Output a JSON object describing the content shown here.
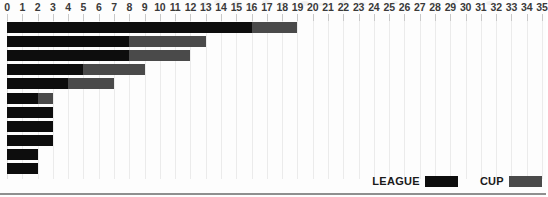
{
  "chart_data": {
    "type": "bar",
    "orientation": "horizontal",
    "stacked": true,
    "title": "",
    "xlabel": "",
    "ylabel": "",
    "xlim": [
      0,
      35
    ],
    "grid": true,
    "legend_position": "bottom-right",
    "x_ticks": [
      0,
      1,
      2,
      3,
      4,
      5,
      6,
      7,
      8,
      9,
      10,
      11,
      12,
      13,
      14,
      15,
      16,
      17,
      18,
      19,
      20,
      21,
      22,
      23,
      24,
      25,
      26,
      27,
      28,
      29,
      30,
      31,
      32,
      33,
      34,
      35
    ],
    "x_tick_labels": [
      "0",
      "1",
      "2",
      "3",
      "4",
      "5",
      "6",
      "7",
      "8",
      "9",
      "10",
      "11",
      "12",
      "13",
      "14",
      "15",
      "16",
      "17",
      "18",
      "19",
      "20",
      "21",
      "22",
      "23",
      "24",
      "25",
      "26",
      "27",
      "28",
      "29",
      "30",
      "31",
      "32",
      "33",
      "34",
      "35"
    ],
    "categories": [
      "1",
      "2",
      "3",
      "4",
      "5",
      "6",
      "7",
      "8",
      "9",
      "10",
      "11"
    ],
    "series": [
      {
        "name": "LEAGUE",
        "color": "#0d0d0d",
        "values": [
          16,
          8,
          8,
          5,
          4,
          2,
          3,
          3,
          3,
          2,
          2
        ]
      },
      {
        "name": "CUP",
        "color": "#4a4a4a",
        "values": [
          3,
          5,
          4,
          4,
          3,
          1,
          0,
          0,
          0,
          0,
          0
        ]
      }
    ],
    "totals": [
      19,
      13,
      12,
      9,
      7,
      3,
      3,
      3,
      3,
      2,
      2
    ]
  },
  "legend": {
    "entries": [
      {
        "label": "LEAGUE",
        "color": "#0d0d0d"
      },
      {
        "label": "CUP",
        "color": "#4a4a4a"
      }
    ]
  },
  "colors": {
    "league": "#0d0d0d",
    "cup": "#4a4a4a",
    "background": "#fdfdfd",
    "gridline": "#ebebeb",
    "tick_label": "#3a3a3a",
    "baseline": "#8f8f8f"
  }
}
